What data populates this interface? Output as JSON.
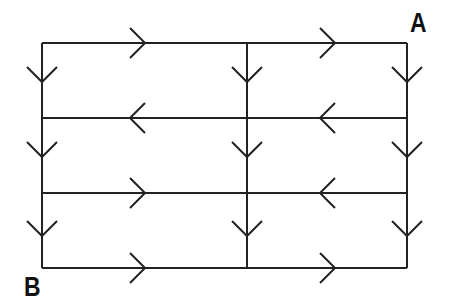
{
  "labels": {
    "start": "A",
    "end": "B"
  },
  "grid": {
    "xs": [
      42,
      247,
      407
    ],
    "ys": [
      43,
      118,
      193,
      268
    ],
    "color": "#222222"
  },
  "h_arrows": [
    {
      "row": 0,
      "seg": 0,
      "dir": "right",
      "x": 145
    },
    {
      "row": 0,
      "seg": 1,
      "dir": "right",
      "x": 335
    },
    {
      "row": 1,
      "seg": 0,
      "dir": "left",
      "x": 130
    },
    {
      "row": 1,
      "seg": 1,
      "dir": "left",
      "x": 320
    },
    {
      "row": 2,
      "seg": 0,
      "dir": "right",
      "x": 145
    },
    {
      "row": 2,
      "seg": 1,
      "dir": "left",
      "x": 320
    },
    {
      "row": 3,
      "seg": 0,
      "dir": "right",
      "x": 145
    },
    {
      "row": 3,
      "seg": 1,
      "dir": "right",
      "x": 335
    }
  ],
  "v_arrows": {
    "dir": "down",
    "tips_y": [
      82,
      157,
      236
    ]
  }
}
